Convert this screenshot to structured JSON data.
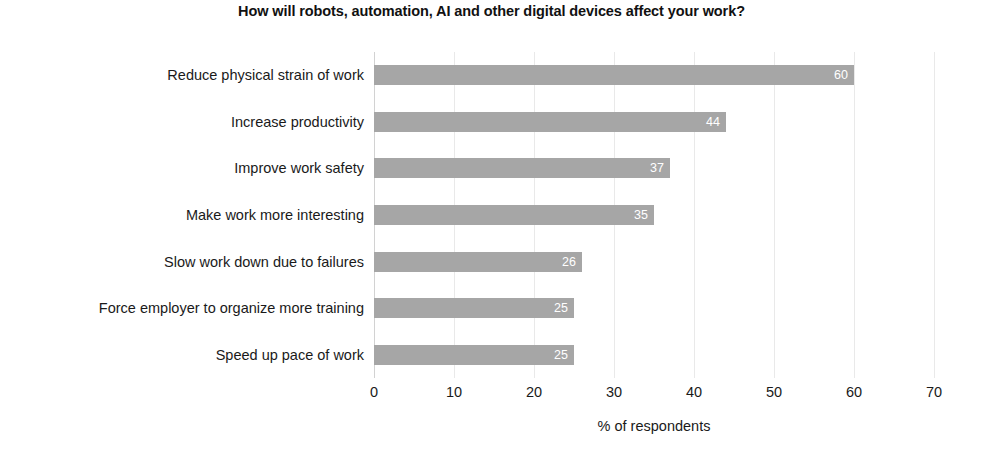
{
  "chart_data": {
    "type": "bar",
    "orientation": "horizontal",
    "title": "How will robots, automation, AI and other digital devices affect your work?",
    "xlabel": "% of respondents",
    "ylabel": "",
    "xlim": [
      0,
      70
    ],
    "xticks": [
      0,
      10,
      20,
      30,
      40,
      50,
      60,
      70
    ],
    "xtick_labels": [
      "0",
      "10",
      "20",
      "30",
      "40",
      "50",
      "60",
      "70"
    ],
    "grid": "vertical",
    "legend": "none",
    "categories": [
      "Reduce physical strain of work",
      "Increase productivity",
      "Improve work safety",
      "Make work more interesting",
      "Slow work down due to failures",
      "Force employer to organize more training",
      "Speed up pace of work"
    ],
    "values": [
      60,
      44,
      37,
      35,
      26,
      25,
      25
    ],
    "value_labels": [
      "60",
      "44",
      "37",
      "35",
      "26",
      "25",
      "25"
    ],
    "bar_color": "#a6a6a6",
    "value_label_color": "#ffffff",
    "grid_color": "#e9e9e9",
    "text_color": "#1a1a1a",
    "background_color": "#ffffff"
  }
}
